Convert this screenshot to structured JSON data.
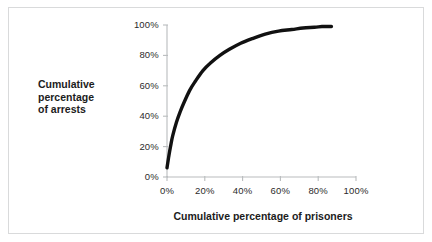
{
  "chart_data": {
    "type": "line",
    "title": "",
    "xlabel": "Cumulative percentage of prisoners",
    "ylabel": "Cumulative percentage of arrests",
    "xlim": [
      0,
      100
    ],
    "ylim": [
      0,
      100
    ],
    "grid": false,
    "legend": null,
    "xtick_labels": [
      "0%",
      "20%",
      "40%",
      "60%",
      "80%",
      "100%"
    ],
    "xticks": [
      0,
      20,
      40,
      60,
      80,
      100
    ],
    "ytick_labels": [
      "0%",
      "20%",
      "40%",
      "60%",
      "80%",
      "100%"
    ],
    "yticks": [
      0,
      20,
      40,
      60,
      80,
      100
    ],
    "series": [
      {
        "name": "Cumulative arrests concentration curve",
        "x": [
          0,
          1,
          2,
          3,
          5,
          7,
          9,
          12,
          15,
          19,
          23,
          28,
          33,
          39,
          45,
          52,
          59,
          66,
          72,
          78,
          82,
          85,
          87
        ],
        "y": [
          6,
          14,
          21,
          27,
          36,
          43,
          49,
          57,
          63,
          70,
          75,
          80,
          84,
          88,
          91,
          94,
          96,
          97,
          98,
          98.5,
          99,
          99,
          99
        ],
        "color": "#111111",
        "linewidth": 3.4
      }
    ],
    "axis_color": "#b9bcbe",
    "tick_label_color": "#2b2b2b",
    "background": "#ffffff",
    "frame_color": "#d9dadb"
  },
  "labels": {
    "ylabel_line1": "Cumulative",
    "ylabel_line2": "percentage",
    "ylabel_line3": "of arrests",
    "xlabel": "Cumulative percentage of prisoners"
  }
}
